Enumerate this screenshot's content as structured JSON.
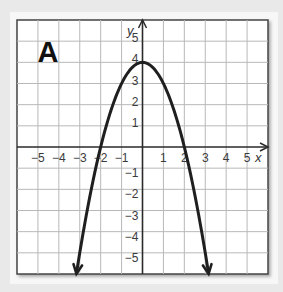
{
  "figure": {
    "label": "A",
    "x_axis_label": "x",
    "y_axis_label": "y"
  },
  "colors": {
    "background": "#e9e9e9",
    "panel": "#f7f7f7",
    "grid_fill": "#ffffff",
    "grid_line": "#b8b8b8",
    "axis": "#2a2a2a",
    "curve": "#1f1f1f",
    "text": "#3a3a3a"
  },
  "chart_data": {
    "type": "line",
    "title": "A",
    "xlabel": "x",
    "ylabel": "y",
    "function": "y = -x^2 + 4",
    "xlim": [
      -6,
      6
    ],
    "ylim": [
      -6,
      6
    ],
    "grid": true,
    "x_ticks": [
      -5,
      -4,
      -3,
      -2,
      -1,
      1,
      2,
      3,
      4,
      5
    ],
    "y_ticks": [
      -5,
      -4,
      -3,
      -2,
      -1,
      1,
      2,
      3,
      4,
      5
    ],
    "x_tick_labels": [
      "−5",
      "−4",
      "−3",
      "−2",
      "−1",
      "1",
      "2",
      "3",
      "4",
      "5"
    ],
    "y_tick_labels": [
      "5",
      "4",
      "3",
      "2",
      "1",
      "−1",
      "−2",
      "−3",
      "−4",
      "−5"
    ],
    "series": [
      {
        "name": "parabola",
        "vertex": [
          0,
          4
        ],
        "x_intercepts": [
          -2,
          2
        ],
        "y_intercept": 4,
        "arrow_ends": [
          [
            -3.16,
            -6
          ],
          [
            3.16,
            -6
          ]
        ],
        "x": [
          -3.16,
          -3,
          -2.5,
          -2,
          -1.5,
          -1,
          -0.5,
          0,
          0.5,
          1,
          1.5,
          2,
          2.5,
          3,
          3.16
        ],
        "values": [
          -6,
          -5,
          -2.25,
          0,
          1.75,
          3,
          3.75,
          4,
          3.75,
          3,
          1.75,
          0,
          -2.25,
          -5,
          -6
        ]
      }
    ],
    "legend": null
  }
}
